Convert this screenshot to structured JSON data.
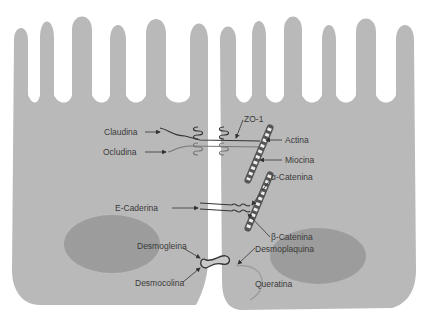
{
  "colors": {
    "cytoplasm": "#b9b9b9",
    "nucleus": "#9c9c9c",
    "background": "#ffffff",
    "line": "#333333",
    "label": "#3a3a3a"
  },
  "labels": {
    "claudina": "Claudina",
    "ocludina": "Ocludina",
    "zo1": "ZO-1",
    "actina": "Actina",
    "miocina": "Miocina",
    "alpha_catenina": "α-Catenina",
    "e_caderina": "E-Caderina",
    "beta_catenina": "β-Catenina",
    "desmogleina": "Desmogleina",
    "desmoplaquina": "Desmoplaquina",
    "desmocolina": "Desmocolina",
    "queratina": "Queratina"
  }
}
